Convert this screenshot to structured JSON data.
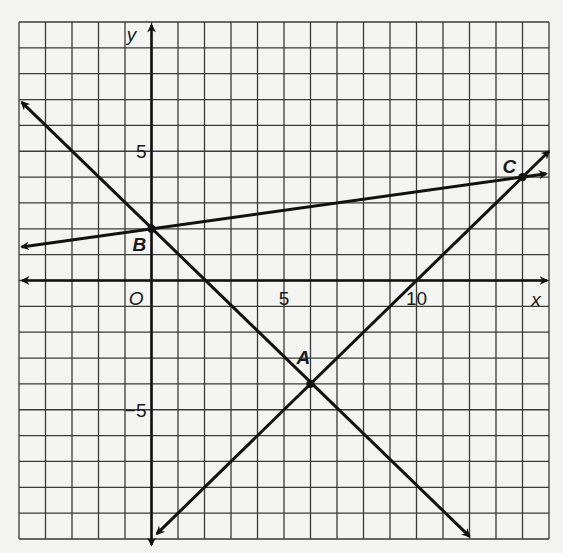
{
  "chart_data": {
    "type": "line",
    "title": "",
    "xlabel": "x",
    "ylabel": "y",
    "xlim": [
      -5,
      15
    ],
    "ylim": [
      -10,
      10
    ],
    "grid": true,
    "grid_step": 1,
    "origin_label": "O",
    "x_ticks": [
      {
        "value": 5,
        "label": "5"
      },
      {
        "value": 10,
        "label": "10"
      }
    ],
    "y_ticks": [
      {
        "value": 5,
        "label": "5"
      },
      {
        "value": -5,
        "label": "−5"
      }
    ],
    "points": [
      {
        "name": "A",
        "x": 6,
        "y": -4
      },
      {
        "name": "B",
        "x": 0,
        "y": 2
      },
      {
        "name": "C",
        "x": 14,
        "y": 4
      }
    ],
    "series": [
      {
        "name": "line BA",
        "through": [
          "B",
          "A"
        ],
        "slope": -1,
        "intercept": 2,
        "x": [
          -4.9,
          12
        ],
        "y": [
          6.9,
          -9.9
        ],
        "arrows": "both"
      },
      {
        "name": "line AC",
        "through": [
          "A",
          "C"
        ],
        "slope": 1,
        "intercept": -10,
        "x": [
          0.2,
          15
        ],
        "y": [
          -9.8,
          5
        ],
        "arrows": "both"
      },
      {
        "name": "line BC",
        "through": [
          "B",
          "C"
        ],
        "slope": 0.142857,
        "intercept": 2,
        "x": [
          -4.9,
          14.9
        ],
        "y": [
          1.3,
          4.13
        ],
        "arrows": "both"
      }
    ],
    "colors": {
      "background": "#f4f4f2",
      "grid": "#3a3a3a",
      "ink": "#111111"
    }
  }
}
